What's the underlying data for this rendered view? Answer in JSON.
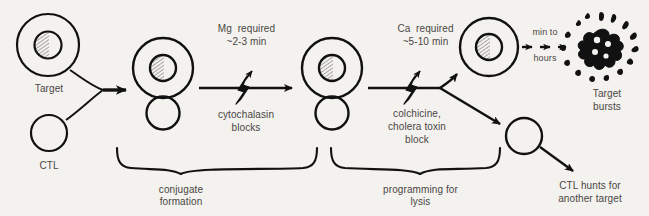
{
  "figure": {
    "background_color": "#f4f2ef",
    "ink_color": "#111111",
    "text_color": "#4a4644"
  },
  "cells": {
    "target_label": "Target",
    "ctl_label": "CTL",
    "burst_label_line1": "Target",
    "burst_label_line2": "bursts"
  },
  "steps": {
    "step1": {
      "requirement": "Mg  required",
      "duration": "~2-3 min",
      "inhibitor_line1": "cytochalasin",
      "inhibitor_line2": "blocks"
    },
    "step2": {
      "requirement": "Ca  required",
      "duration": "~5-10 min",
      "inhibitor_line1": "colchicine,",
      "inhibitor_line2": "cholera toxin",
      "inhibitor_line3": "block"
    },
    "step3": {
      "timing_line1": "min to",
      "timing_line2": "hours"
    }
  },
  "braces": {
    "brace1_line1": "conjugate",
    "brace1_line2": "formation",
    "brace2_line1": "programming for",
    "brace2_line2": "lysis"
  },
  "outcomes": {
    "ctl_recycle_line1": "CTL hunts for",
    "ctl_recycle_line2": "another target"
  }
}
